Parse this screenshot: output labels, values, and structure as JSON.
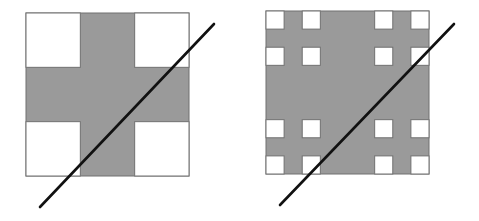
{
  "figure": {
    "colors": {
      "fill": "#9a9a9a",
      "hole": "#ffffff",
      "outline": "#707070",
      "line": "#111111",
      "background": "#ffffff"
    },
    "panels": [
      {
        "id": "stage-1",
        "square": {
          "x": 26,
          "y": 13,
          "size": 163
        },
        "level": 1,
        "line": {
          "x1": 214,
          "y1": 24,
          "x2": 40,
          "y2": 207
        }
      },
      {
        "id": "stage-2",
        "square": {
          "x": 266,
          "y": 11,
          "size": 163
        },
        "level": 2,
        "line": {
          "x1": 454,
          "y1": 24,
          "x2": 280,
          "y2": 205
        }
      }
    ]
  }
}
